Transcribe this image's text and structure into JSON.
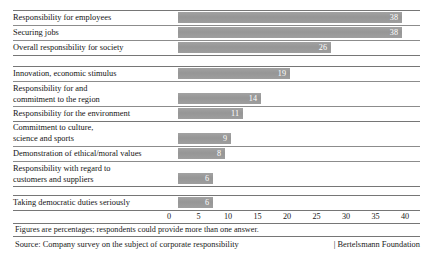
{
  "chart_data": {
    "type": "bar",
    "orientation": "horizontal",
    "title": "",
    "xlabel": "",
    "ylabel": "",
    "xlim": [
      0,
      40
    ],
    "grid": false,
    "legend": null,
    "tick_labels": [
      "0",
      "5",
      "10",
      "15",
      "20",
      "25",
      "30",
      "35",
      "40"
    ],
    "tick_values": [
      0,
      5,
      10,
      15,
      20,
      25,
      30,
      35,
      40
    ],
    "categories": [
      "Responsibility for employees",
      "Securing jobs",
      "Overall responsibility for society",
      "Innovation, economic stimulus",
      "Responsibility for and\ncommitment to the region",
      "Responsibility for the environment",
      "Commitment to culture,\nscience and sports",
      "Demonstration of ethical/moral values",
      "Responsibility with regard to\ncustomers and suppliers",
      "Taking democratic duties seriously"
    ],
    "values": [
      38,
      38,
      26,
      19,
      14,
      11,
      9,
      8,
      6,
      6
    ],
    "value_labels": [
      "38",
      "38",
      "26",
      "19",
      "14",
      "11",
      "9",
      "8",
      "6",
      "6"
    ],
    "units": "percent",
    "bar_color": "#9a9a9a",
    "value_label_color": "#ffffff",
    "group_breaks_after": [
      2,
      5,
      8
    ],
    "footnote": "Figures are percentages; respondents could provide more than one answer.",
    "source": "Source: Company survey on the subject of corporate responsibility",
    "credit": "| Bertelsmann Foundation"
  }
}
